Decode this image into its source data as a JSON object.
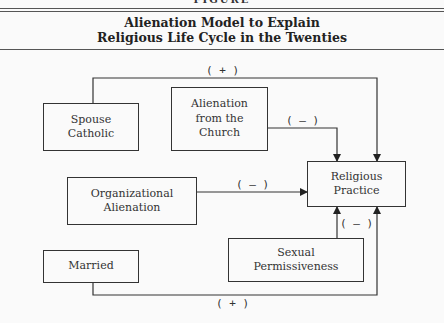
{
  "figure": {
    "label": "FIGURE",
    "title_line1": "Alienation Model to Explain",
    "title_line2": "Religious Life Cycle in the Twenties"
  },
  "nodes": {
    "spouse_catholic": "Spouse\nCatholic",
    "alienation_church": "Alienation\nfrom the\nChurch",
    "organizational_alienation": "Organizational\nAlienation",
    "religious_practice": "Religious\nPractice",
    "sexual_permissiveness": "Sexual\nPermissiveness",
    "married": "Married"
  },
  "edges": [
    {
      "from": "Spouse Catholic",
      "to": "Religious Practice",
      "sign": "( + )"
    },
    {
      "from": "Alienation from the Church",
      "to": "Religious Practice",
      "sign": "( – )"
    },
    {
      "from": "Organizational Alienation",
      "to": "Religious Practice",
      "sign": "( – )"
    },
    {
      "from": "Sexual Permissiveness",
      "to": "Religious Practice",
      "sign": "( – )"
    },
    {
      "from": "Married",
      "to": "Religious Practice",
      "sign": "( + )"
    }
  ]
}
